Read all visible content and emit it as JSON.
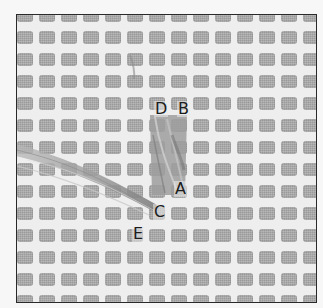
{
  "figure": {
    "colors": {
      "background": "#f7f7f7",
      "mesh_thread": "#eeeeee",
      "mesh_hole": "#a9a9a9",
      "frame_border": "#2a2a2a",
      "yarn": "#8e8e8e",
      "label_text": "#1c1c1c"
    },
    "grid": {
      "columns": 14,
      "rows": 14,
      "pitch_px": 22
    },
    "labels": [
      {
        "id": "D",
        "text": "D",
        "x": 137,
        "y": 86
      },
      {
        "id": "B",
        "text": "B",
        "x": 160,
        "y": 86
      },
      {
        "id": "A",
        "text": "A",
        "x": 157,
        "y": 166
      },
      {
        "id": "C",
        "text": "C",
        "x": 136,
        "y": 189
      },
      {
        "id": "E",
        "text": "E",
        "x": 115,
        "y": 211
      }
    ]
  }
}
